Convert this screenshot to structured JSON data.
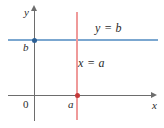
{
  "figure": {
    "type": "coordinate-plane-diagram",
    "width": 164,
    "height": 128,
    "background": "#ffffff"
  },
  "axes": {
    "x_axis_label": "x",
    "y_axis_label": "y",
    "origin_label": "0",
    "axis_color": "#6d6d6d"
  },
  "ticks": {
    "x_tick_label": "a",
    "y_tick_label": "b"
  },
  "lines": [
    {
      "name": "horizontal-line",
      "equation_label": "y = b",
      "color": "#7ba7d0",
      "orientation": "horizontal"
    },
    {
      "name": "vertical-line",
      "equation_label": "x = a",
      "color": "#ef9a9a",
      "orientation": "vertical"
    }
  ],
  "points": [
    {
      "name": "y-intercept",
      "label": "b",
      "color": "#2c5f94"
    },
    {
      "name": "x-intercept",
      "label": "a",
      "color": "#c43a3a"
    }
  ],
  "chart_data": {
    "type": "line",
    "title": "",
    "xlabel": "x",
    "ylabel": "y",
    "xlim": [
      -0.6,
      3.1
    ],
    "ylim": [
      -0.7,
      2.4
    ],
    "grid": false,
    "legend": "none",
    "series": [
      {
        "name": "y = b",
        "equation": "y = b",
        "color": "#7ba7d0",
        "orientation": "horizontal",
        "value": "b",
        "x": [
          -0.6,
          3.1
        ],
        "y": [
          1.5,
          1.5
        ]
      },
      {
        "name": "x = a",
        "equation": "x = a",
        "color": "#ef9a9a",
        "orientation": "vertical",
        "value": "a",
        "x": [
          1.0,
          1.0
        ],
        "y": [
          -0.7,
          2.4
        ]
      }
    ],
    "annotations": [
      {
        "text": "y = b",
        "x": 2.0,
        "y": 2.0
      },
      {
        "text": "x = a",
        "x": 1.1,
        "y": 0.75
      },
      {
        "text": "b",
        "x": -0.25,
        "y": 1.32
      },
      {
        "text": "a",
        "x": 0.88,
        "y": -0.2
      },
      {
        "text": "0",
        "x": -0.25,
        "y": -0.2
      }
    ],
    "markers": [
      {
        "label": "b",
        "x": 0.0,
        "y": 1.5,
        "color": "#2c5f94"
      },
      {
        "label": "a",
        "x": 1.0,
        "y": 0.0,
        "color": "#c43a3a"
      }
    ]
  }
}
